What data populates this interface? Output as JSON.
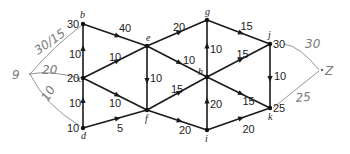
{
  "diagram": {
    "type": "flow-network",
    "colors": {
      "edge": "#1a1a1a",
      "handwriting": "#8a8a8a"
    },
    "nodes": [
      {
        "id": "a",
        "label": "9",
        "x": 30,
        "y": 74,
        "value": "",
        "handwritten": true
      },
      {
        "id": "b",
        "label": "b",
        "x": 83,
        "y": 24,
        "value": "30"
      },
      {
        "id": "c",
        "label": "c",
        "x": 83,
        "y": 78,
        "value": "20"
      },
      {
        "id": "d",
        "label": "d",
        "x": 83,
        "y": 128,
        "value": "10"
      },
      {
        "id": "e",
        "label": "e",
        "x": 147,
        "y": 46,
        "value": ""
      },
      {
        "id": "f",
        "label": "f",
        "x": 147,
        "y": 110,
        "value": ""
      },
      {
        "id": "g",
        "label": "g",
        "x": 207,
        "y": 20,
        "value": ""
      },
      {
        "id": "h",
        "label": "h",
        "x": 207,
        "y": 77,
        "value": ""
      },
      {
        "id": "i",
        "label": "i",
        "x": 207,
        "y": 130,
        "value": ""
      },
      {
        "id": "j",
        "label": "j",
        "x": 270,
        "y": 44,
        "value": "30"
      },
      {
        "id": "k",
        "label": "k",
        "x": 270,
        "y": 108,
        "value": "25"
      },
      {
        "id": "z",
        "label": "Z",
        "x": 322,
        "y": 70,
        "value": "",
        "handwritten": true
      }
    ],
    "edges": [
      {
        "from": "b",
        "to": "e",
        "capacity": "40"
      },
      {
        "from": "c",
        "to": "b",
        "capacity": "10"
      },
      {
        "from": "c",
        "to": "e",
        "capacity": "10"
      },
      {
        "from": "c",
        "to": "f",
        "capacity": "10"
      },
      {
        "from": "d",
        "to": "c",
        "capacity": "10"
      },
      {
        "from": "d",
        "to": "f",
        "capacity": "5"
      },
      {
        "from": "e",
        "to": "g",
        "capacity": "20"
      },
      {
        "from": "e",
        "to": "f",
        "capacity": "10"
      },
      {
        "from": "e",
        "to": "h",
        "capacity": "10"
      },
      {
        "from": "f",
        "to": "h",
        "capacity": "15"
      },
      {
        "from": "f",
        "to": "i",
        "capacity": "20"
      },
      {
        "from": "g",
        "to": "j",
        "capacity": "15"
      },
      {
        "from": "h",
        "to": "g",
        "capacity": "10"
      },
      {
        "from": "h",
        "to": "j",
        "capacity": "15"
      },
      {
        "from": "h",
        "to": "k",
        "capacity": "15"
      },
      {
        "from": "i",
        "to": "h",
        "capacity": "20"
      },
      {
        "from": "i",
        "to": "k",
        "capacity": "20"
      },
      {
        "from": "j",
        "to": "k",
        "capacity": "10"
      }
    ],
    "handwritten_edges": [
      {
        "from": "a",
        "to": "b",
        "label": "30/15"
      },
      {
        "from": "a",
        "to": "c",
        "label": "20"
      },
      {
        "from": "a",
        "to": "d",
        "label": "10"
      },
      {
        "from": "j",
        "to": "z",
        "label": "30"
      },
      {
        "from": "k",
        "to": "z",
        "label": "25"
      }
    ]
  }
}
